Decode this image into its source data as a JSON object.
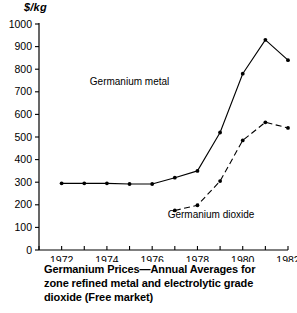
{
  "chart_data": {
    "type": "line",
    "title": "Germanium Prices—Annual Averages for zone refined metal and electrolytic grade dioxide (Free market)",
    "xlabel": "",
    "ylabel": "$/kg",
    "ylim": [
      0,
      1000
    ],
    "xlim": [
      1971,
      1982
    ],
    "grid": false,
    "legend_position": "inline-annotation",
    "ytick_labels": [
      "0",
      "100",
      "200",
      "300",
      "400",
      "500",
      "600",
      "700",
      "800",
      "900",
      "1000"
    ],
    "yticks": [
      0,
      100,
      200,
      300,
      400,
      500,
      600,
      700,
      800,
      900,
      1000
    ],
    "xticks": [
      1971,
      1972,
      1973,
      1974,
      1975,
      1976,
      1977,
      1978,
      1979,
      1980,
      1981,
      1982
    ],
    "xtick_labels": [
      "1972",
      "1974",
      "1976",
      "1978",
      "1980",
      "1982"
    ],
    "xtick_label_values": [
      1972,
      1974,
      1976,
      1978,
      1980,
      1982
    ],
    "series": [
      {
        "name": "Germanium metal",
        "style": "solid",
        "x": [
          1972,
          1973,
          1974,
          1975,
          1976,
          1977,
          1978,
          1979,
          1980,
          1981,
          1982
        ],
        "values": [
          295,
          295,
          295,
          292,
          292,
          320,
          350,
          520,
          780,
          930,
          840
        ]
      },
      {
        "name": "Germanium dioxide",
        "style": "dashed",
        "x": [
          1977,
          1978,
          1979,
          1980,
          1981,
          1982
        ],
        "values": [
          175,
          198,
          305,
          485,
          565,
          540
        ]
      }
    ],
    "annotations": [
      {
        "text": "Germanium metal",
        "x": 1975.0,
        "y": 730
      },
      {
        "text": "Germanium dioxide",
        "x": 1978.6,
        "y": 140
      }
    ]
  },
  "figure": {
    "y_unit_label": "$/kg",
    "caption_line_1": "Germanium Prices—Annual Averages for",
    "caption_line_2": "zone refined metal and electrolytic grade",
    "caption_line_3": "dioxide (Free market)"
  }
}
